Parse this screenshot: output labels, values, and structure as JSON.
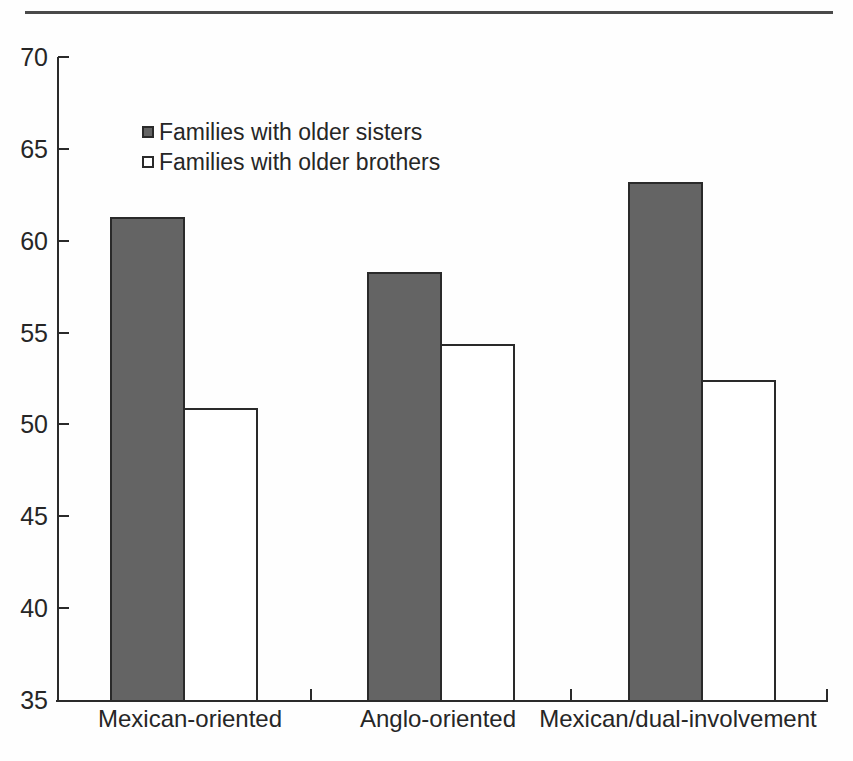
{
  "chart_data": {
    "type": "bar",
    "title": "",
    "xlabel": "",
    "ylabel": "",
    "categories": [
      "Mexican-oriented",
      "Anglo-oriented",
      "Mexican/dual-involvement"
    ],
    "series": [
      {
        "name": "Families with older sisters",
        "values": [
          61.3,
          58.3,
          63.2
        ],
        "fill": "#646464"
      },
      {
        "name": "Families with older brothers",
        "values": [
          50.9,
          54.4,
          52.4
        ],
        "fill": "#ffffff"
      }
    ],
    "ylim": [
      35,
      70
    ],
    "yticks": [
      35,
      40,
      45,
      50,
      55,
      60,
      65,
      70
    ],
    "grid": false,
    "legend_position": "top-left-inside",
    "colors": {
      "axis": "#2a2a2a",
      "text": "#262626",
      "bar_outline": "#2a2a2a",
      "top_rule": "#4a4a4a",
      "background": "#fefefe"
    }
  }
}
